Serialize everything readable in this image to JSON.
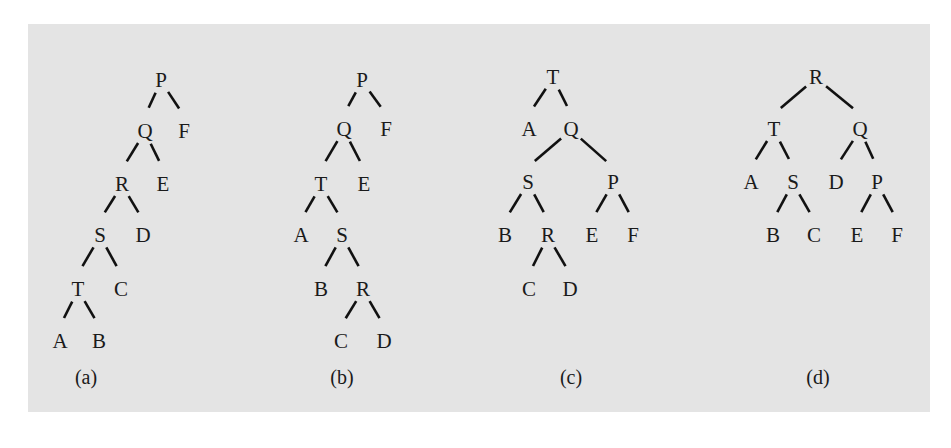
{
  "figure": {
    "background_color": "#e4e4e4",
    "ink_color": "#1a1a1a",
    "trees": [
      {
        "id": "a",
        "caption": "(a)",
        "caption_pos": [
          86,
          384
        ],
        "nodes": [
          {
            "id": "P",
            "label": "P",
            "x": 161,
            "y": 79
          },
          {
            "id": "Q",
            "label": "Q",
            "x": 145,
            "y": 130
          },
          {
            "id": "F",
            "label": "F",
            "x": 184,
            "y": 130
          },
          {
            "id": "R",
            "label": "R",
            "x": 122,
            "y": 183
          },
          {
            "id": "E",
            "label": "E",
            "x": 163,
            "y": 183
          },
          {
            "id": "S",
            "label": "S",
            "x": 100,
            "y": 234
          },
          {
            "id": "D",
            "label": "D",
            "x": 143,
            "y": 234
          },
          {
            "id": "T",
            "label": "T",
            "x": 78,
            "y": 288
          },
          {
            "id": "C",
            "label": "C",
            "x": 121,
            "y": 288
          },
          {
            "id": "A",
            "label": "A",
            "x": 60,
            "y": 340
          },
          {
            "id": "B",
            "label": "B",
            "x": 99,
            "y": 340
          }
        ],
        "edges": [
          [
            "P",
            "Q"
          ],
          [
            "P",
            "F"
          ],
          [
            "Q",
            "R"
          ],
          [
            "Q",
            "E"
          ],
          [
            "R",
            "S"
          ],
          [
            "R",
            "D"
          ],
          [
            "S",
            "T"
          ],
          [
            "S",
            "C"
          ],
          [
            "T",
            "A"
          ],
          [
            "T",
            "B"
          ]
        ]
      },
      {
        "id": "b",
        "caption": "(b)",
        "caption_pos": [
          342,
          384
        ],
        "nodes": [
          {
            "id": "P",
            "label": "P",
            "x": 362,
            "y": 79
          },
          {
            "id": "Q",
            "label": "Q",
            "x": 344,
            "y": 128
          },
          {
            "id": "F",
            "label": "F",
            "x": 386,
            "y": 128
          },
          {
            "id": "T",
            "label": "T",
            "x": 321,
            "y": 183
          },
          {
            "id": "E",
            "label": "E",
            "x": 364,
            "y": 183
          },
          {
            "id": "A",
            "label": "A",
            "x": 301,
            "y": 234
          },
          {
            "id": "S",
            "label": "S",
            "x": 342,
            "y": 234
          },
          {
            "id": "B",
            "label": "B",
            "x": 321,
            "y": 288
          },
          {
            "id": "R",
            "label": "R",
            "x": 363,
            "y": 288
          },
          {
            "id": "C",
            "label": "C",
            "x": 341,
            "y": 340
          },
          {
            "id": "D",
            "label": "D",
            "x": 384,
            "y": 340
          }
        ],
        "edges": [
          [
            "P",
            "Q"
          ],
          [
            "P",
            "F"
          ],
          [
            "Q",
            "T"
          ],
          [
            "Q",
            "E"
          ],
          [
            "T",
            "A"
          ],
          [
            "T",
            "S"
          ],
          [
            "S",
            "B"
          ],
          [
            "S",
            "R"
          ],
          [
            "R",
            "C"
          ],
          [
            "R",
            "D"
          ]
        ]
      },
      {
        "id": "c",
        "caption": "(c)",
        "caption_pos": [
          571,
          384
        ],
        "nodes": [
          {
            "id": "T",
            "label": "T",
            "x": 553,
            "y": 76
          },
          {
            "id": "A",
            "label": "A",
            "x": 529,
            "y": 128
          },
          {
            "id": "Q",
            "label": "Q",
            "x": 571,
            "y": 128
          },
          {
            "id": "S",
            "label": "S",
            "x": 528,
            "y": 181
          },
          {
            "id": "P",
            "label": "P",
            "x": 613,
            "y": 181
          },
          {
            "id": "B",
            "label": "B",
            "x": 505,
            "y": 234
          },
          {
            "id": "R",
            "label": "R",
            "x": 548,
            "y": 234
          },
          {
            "id": "E",
            "label": "E",
            "x": 592,
            "y": 234
          },
          {
            "id": "F",
            "label": "F",
            "x": 633,
            "y": 234
          },
          {
            "id": "C",
            "label": "C",
            "x": 529,
            "y": 288
          },
          {
            "id": "D",
            "label": "D",
            "x": 570,
            "y": 288
          }
        ],
        "edges": [
          [
            "T",
            "A"
          ],
          [
            "T",
            "Q"
          ],
          [
            "Q",
            "S"
          ],
          [
            "Q",
            "P"
          ],
          [
            "S",
            "B"
          ],
          [
            "S",
            "R"
          ],
          [
            "P",
            "E"
          ],
          [
            "P",
            "F"
          ],
          [
            "R",
            "C"
          ],
          [
            "R",
            "D"
          ]
        ]
      },
      {
        "id": "d",
        "caption": "(d)",
        "caption_pos": [
          818,
          384
        ],
        "nodes": [
          {
            "id": "R",
            "label": "R",
            "x": 816,
            "y": 76
          },
          {
            "id": "T",
            "label": "T",
            "x": 774,
            "y": 128
          },
          {
            "id": "Q",
            "label": "Q",
            "x": 860,
            "y": 128
          },
          {
            "id": "A",
            "label": "A",
            "x": 751,
            "y": 181
          },
          {
            "id": "S",
            "label": "S",
            "x": 793,
            "y": 181
          },
          {
            "id": "D",
            "label": "D",
            "x": 836,
            "y": 181
          },
          {
            "id": "P",
            "label": "P",
            "x": 877,
            "y": 181
          },
          {
            "id": "B",
            "label": "B",
            "x": 773,
            "y": 234
          },
          {
            "id": "C",
            "label": "C",
            "x": 814,
            "y": 234
          },
          {
            "id": "E",
            "label": "E",
            "x": 857,
            "y": 234
          },
          {
            "id": "F",
            "label": "F",
            "x": 897,
            "y": 234
          }
        ],
        "edges": [
          [
            "R",
            "T"
          ],
          [
            "R",
            "Q"
          ],
          [
            "T",
            "A"
          ],
          [
            "T",
            "S"
          ],
          [
            "Q",
            "D"
          ],
          [
            "Q",
            "P"
          ],
          [
            "S",
            "B"
          ],
          [
            "S",
            "C"
          ],
          [
            "P",
            "E"
          ],
          [
            "P",
            "F"
          ]
        ]
      }
    ]
  }
}
